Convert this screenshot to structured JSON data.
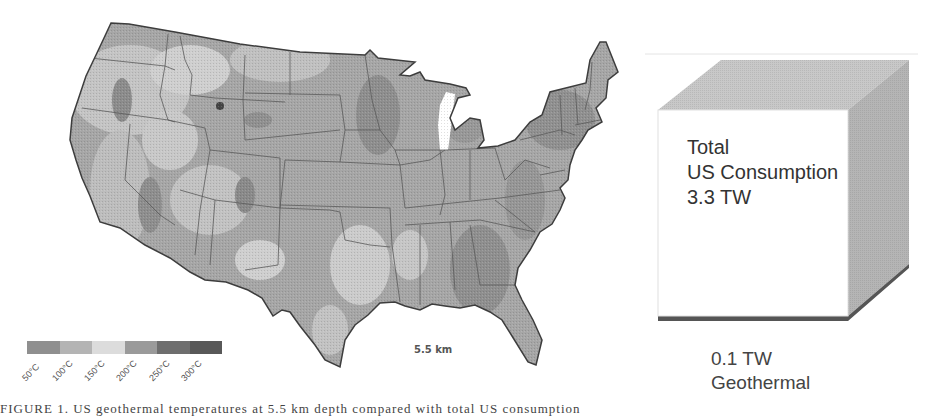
{
  "map": {
    "title": "US geothermal temperature map",
    "scale_label": "5.5 km",
    "legend": {
      "labels": [
        "50°C",
        "100°C",
        "150°C",
        "200°C",
        "250°C",
        "300°C"
      ],
      "colors": [
        "#8f8f8f",
        "#b4b4b4",
        "#dcdcdc",
        "#9a9a9a",
        "#6e6e6e",
        "#585858"
      ]
    }
  },
  "cube": {
    "line1": "Total",
    "line2": "US Consumption",
    "line3": "3.3 TW",
    "geothermal_value": "0.1 TW",
    "geothermal_label": "Geothermal",
    "colors": {
      "front": "#ffffff",
      "top": "#c8c8c8",
      "side": "#b8b8b8",
      "base": "#555555"
    }
  },
  "caption": "FIGURE 1. US geothermal temperatures at 5.5 km depth compared with total US consumption"
}
